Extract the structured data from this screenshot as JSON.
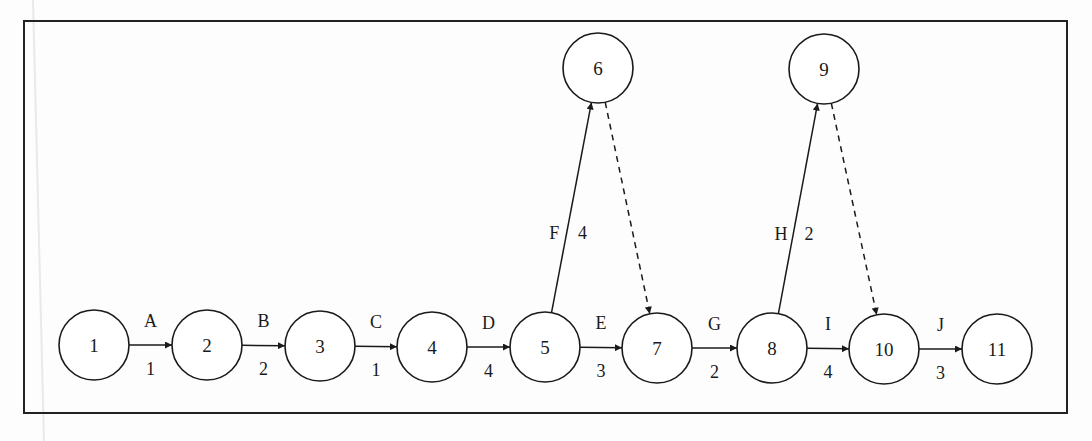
{
  "diagram": {
    "type": "activity-on-arrow network",
    "nodes": [
      {
        "id": "1",
        "label": "1",
        "x": 94,
        "y": 345
      },
      {
        "id": "2",
        "label": "2",
        "x": 207,
        "y": 345
      },
      {
        "id": "3",
        "label": "3",
        "x": 320,
        "y": 346
      },
      {
        "id": "4",
        "label": "4",
        "x": 432,
        "y": 347
      },
      {
        "id": "5",
        "label": "5",
        "x": 545,
        "y": 347
      },
      {
        "id": "6",
        "label": "6",
        "x": 598,
        "y": 68
      },
      {
        "id": "7",
        "label": "7",
        "x": 657,
        "y": 348
      },
      {
        "id": "8",
        "label": "8",
        "x": 772,
        "y": 348
      },
      {
        "id": "9",
        "label": "9",
        "x": 824,
        "y": 69
      },
      {
        "id": "10",
        "label": "10",
        "x": 884,
        "y": 349
      },
      {
        "id": "11",
        "label": "11",
        "x": 997,
        "y": 349
      }
    ],
    "edges": [
      {
        "from": "1",
        "to": "2",
        "activity": "A",
        "duration": "1",
        "dummy": false
      },
      {
        "from": "2",
        "to": "3",
        "activity": "B",
        "duration": "2",
        "dummy": false
      },
      {
        "from": "3",
        "to": "4",
        "activity": "C",
        "duration": "1",
        "dummy": false
      },
      {
        "from": "4",
        "to": "5",
        "activity": "D",
        "duration": "4",
        "dummy": false
      },
      {
        "from": "5",
        "to": "7",
        "activity": "E",
        "duration": "3",
        "dummy": false
      },
      {
        "from": "5",
        "to": "6",
        "activity": "F",
        "duration": "4",
        "dummy": false
      },
      {
        "from": "6",
        "to": "7",
        "activity": "",
        "duration": "",
        "dummy": true
      },
      {
        "from": "7",
        "to": "8",
        "activity": "G",
        "duration": "2",
        "dummy": false
      },
      {
        "from": "8",
        "to": "9",
        "activity": "H",
        "duration": "2",
        "dummy": false
      },
      {
        "from": "9",
        "to": "10",
        "activity": "",
        "duration": "",
        "dummy": true
      },
      {
        "from": "8",
        "to": "10",
        "activity": "I",
        "duration": "4",
        "dummy": false
      },
      {
        "from": "10",
        "to": "11",
        "activity": "J",
        "duration": "3",
        "dummy": false
      }
    ]
  }
}
